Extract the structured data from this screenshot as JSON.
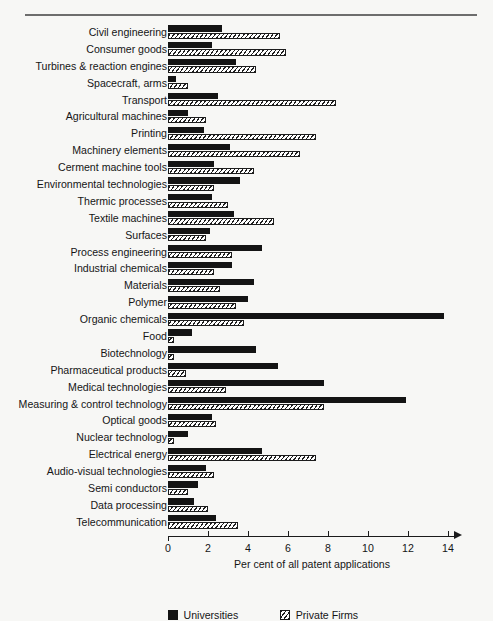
{
  "chart_data": {
    "type": "bar",
    "orientation": "horizontal",
    "title": "",
    "xlabel": "Per cent of all patent applications",
    "ylabel": "",
    "xlim": [
      0,
      14
    ],
    "xticks": [
      0,
      2,
      4,
      6,
      8,
      10,
      12,
      14
    ],
    "xtick_labels": [
      "0",
      "2",
      "4",
      "6",
      "8",
      "10",
      "12",
      "14"
    ],
    "grid": false,
    "legend_position": "bottom-left",
    "categories": [
      "Civil engineering",
      "Consumer goods",
      "Turbines & reaction engines",
      "Spacecraft, arms",
      "Transport",
      "Agricultural machines",
      "Printing",
      "Machinery elements",
      "Cerment machine tools",
      "Environmental technologies",
      "Thermic processes",
      "Textile machines",
      "Surfaces",
      "Process engineering",
      "Industrial chemicals",
      "Materials",
      "Polymer",
      "Organic chemicals",
      "Food",
      "Biotechnology",
      "Pharmaceutical products",
      "Medical technologies",
      "Measuring & control technology",
      "Optical goods",
      "Nuclear technology",
      "Electrical energy",
      "Audio-visual technologies",
      "Semi conductors",
      "Data processing",
      "Telecommunication"
    ],
    "series": [
      {
        "name": "Universities",
        "color": "#141414",
        "pattern": "solid",
        "values": [
          2.7,
          2.2,
          3.4,
          0.4,
          2.5,
          1.0,
          1.8,
          3.1,
          2.3,
          3.6,
          2.2,
          3.3,
          2.1,
          4.7,
          3.2,
          4.3,
          4.0,
          13.8,
          1.2,
          4.4,
          5.5,
          7.8,
          11.9,
          2.2,
          1.0,
          4.7,
          1.9,
          1.5,
          1.3,
          2.4
        ]
      },
      {
        "name": "Private Firms",
        "color": "#ffffff",
        "pattern": "diagonal-hatch",
        "values": [
          5.6,
          5.9,
          4.4,
          1.0,
          8.4,
          1.9,
          7.4,
          6.6,
          4.3,
          2.3,
          3.0,
          5.3,
          1.9,
          3.2,
          2.3,
          2.6,
          3.4,
          3.8,
          0.3,
          0.3,
          0.9,
          2.9,
          7.8,
          2.4,
          0.3,
          7.4,
          2.3,
          1.0,
          2.0,
          3.5
        ]
      }
    ]
  },
  "legend": [
    {
      "label": "Universities",
      "swatch": "solid-black-square-icon"
    },
    {
      "label": "Private Firms",
      "swatch": "hatched-square-icon"
    }
  ]
}
